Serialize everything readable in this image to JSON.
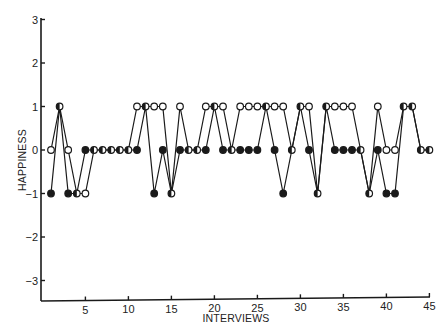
{
  "chart_data": {
    "type": "line",
    "title": "",
    "xlabel": "INTERVIEWS",
    "ylabel": "HAPPINESS",
    "xlim": [
      0,
      45
    ],
    "ylim": [
      -3.5,
      3
    ],
    "x_ticks": [
      5,
      10,
      15,
      20,
      25,
      30,
      35,
      40,
      45
    ],
    "y_ticks": [
      3,
      2,
      1,
      0,
      -1,
      -2,
      -3
    ],
    "grid": false,
    "legend": null,
    "x": [
      1,
      2,
      3,
      4,
      5,
      6,
      7,
      8,
      9,
      10,
      11,
      12,
      13,
      14,
      15,
      16,
      17,
      18,
      19,
      20,
      21,
      22,
      23,
      24,
      25,
      26,
      27,
      28,
      29,
      30,
      31,
      32,
      33,
      34,
      35,
      36,
      37,
      38,
      39,
      40,
      41,
      42,
      43,
      44,
      45
    ],
    "series": [
      {
        "name": "open-circles",
        "marker": "open",
        "values": [
          0,
          1,
          0,
          -1,
          -1,
          0,
          0,
          0,
          0,
          0,
          1,
          1,
          1,
          1,
          -1,
          1,
          0,
          0,
          1,
          1,
          1,
          0,
          1,
          1,
          1,
          1,
          1,
          1,
          0,
          1,
          1,
          -1,
          1,
          1,
          1,
          1,
          0,
          -1,
          1,
          0,
          0,
          1,
          1,
          0,
          0
        ]
      },
      {
        "name": "filled-circles",
        "marker": "filled",
        "values": [
          -1,
          1,
          -1,
          -1,
          0,
          0,
          0,
          0,
          0,
          0,
          0,
          1,
          -1,
          0,
          -1,
          0,
          0,
          0,
          0,
          1,
          0,
          0,
          0,
          0,
          0,
          1,
          0,
          -1,
          0,
          1,
          0,
          -1,
          1,
          0,
          0,
          0,
          0,
          -1,
          0,
          -1,
          -1,
          1,
          1,
          0,
          0
        ]
      }
    ]
  },
  "labels": {
    "xlabel": "INTERVIEWS",
    "ylabel": "HAPPINESS",
    "x_ticks": [
      "5",
      "10",
      "15",
      "20",
      "25",
      "30",
      "35",
      "40",
      "45"
    ],
    "y_ticks": [
      "3",
      "2",
      "1",
      "0",
      "−1",
      "−2",
      "−3"
    ]
  },
  "colors": {
    "ink": "#1a1a1a",
    "background": "#ffffff"
  }
}
